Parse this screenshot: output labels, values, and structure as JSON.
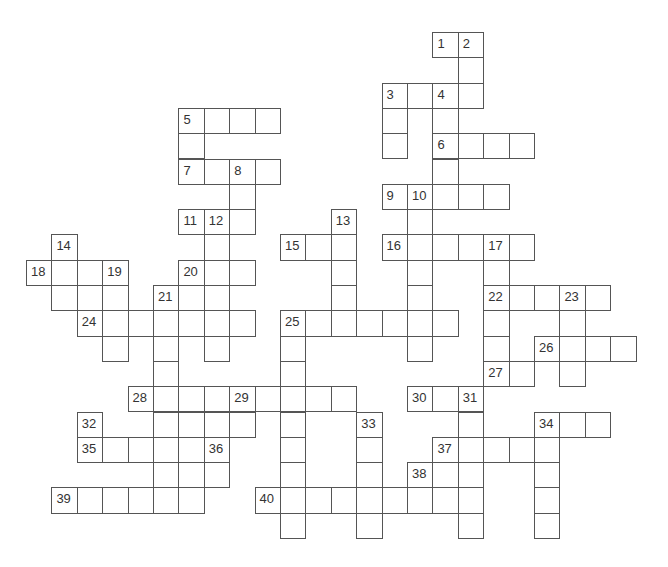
{
  "puzzle": {
    "type": "crossword",
    "grid": {
      "origin_x": 26,
      "origin_y": 32,
      "cell_w": 25.4,
      "cell_h": 25.3,
      "cols": 25,
      "rows": 20
    },
    "colors": {
      "border": "#555555",
      "cell_bg": "#ffffff",
      "number": "#333333"
    },
    "cells": [
      {
        "c": 16,
        "r": 0,
        "n": "1"
      },
      {
        "c": 17,
        "r": 0,
        "n": "2"
      },
      {
        "c": 17,
        "r": 1
      },
      {
        "c": 14,
        "r": 2,
        "n": "3"
      },
      {
        "c": 15,
        "r": 2
      },
      {
        "c": 16,
        "r": 2,
        "n": "4"
      },
      {
        "c": 17,
        "r": 2
      },
      {
        "c": 6,
        "r": 3,
        "n": "5"
      },
      {
        "c": 7,
        "r": 3
      },
      {
        "c": 8,
        "r": 3
      },
      {
        "c": 9,
        "r": 3
      },
      {
        "c": 14,
        "r": 3
      },
      {
        "c": 16,
        "r": 3
      },
      {
        "c": 6,
        "r": 4
      },
      {
        "c": 14,
        "r": 4
      },
      {
        "c": 16,
        "r": 4,
        "n": "6"
      },
      {
        "c": 17,
        "r": 4
      },
      {
        "c": 18,
        "r": 4
      },
      {
        "c": 19,
        "r": 4
      },
      {
        "c": 6,
        "r": 5,
        "n": "7"
      },
      {
        "c": 7,
        "r": 5
      },
      {
        "c": 8,
        "r": 5,
        "n": "8"
      },
      {
        "c": 9,
        "r": 5
      },
      {
        "c": 16,
        "r": 5
      },
      {
        "c": 8,
        "r": 6
      },
      {
        "c": 14,
        "r": 6,
        "n": "9"
      },
      {
        "c": 15,
        "r": 6,
        "n": "10"
      },
      {
        "c": 16,
        "r": 6
      },
      {
        "c": 17,
        "r": 6
      },
      {
        "c": 18,
        "r": 6
      },
      {
        "c": 6,
        "r": 7,
        "n": "11"
      },
      {
        "c": 7,
        "r": 7,
        "n": "12"
      },
      {
        "c": 8,
        "r": 7
      },
      {
        "c": 12,
        "r": 7,
        "n": "13"
      },
      {
        "c": 15,
        "r": 7
      },
      {
        "c": 1,
        "r": 8,
        "n": "14"
      },
      {
        "c": 7,
        "r": 8
      },
      {
        "c": 10,
        "r": 8,
        "n": "15"
      },
      {
        "c": 11,
        "r": 8
      },
      {
        "c": 12,
        "r": 8
      },
      {
        "c": 14,
        "r": 8,
        "n": "16"
      },
      {
        "c": 15,
        "r": 8
      },
      {
        "c": 16,
        "r": 8
      },
      {
        "c": 17,
        "r": 8
      },
      {
        "c": 18,
        "r": 8,
        "n": "17"
      },
      {
        "c": 19,
        "r": 8
      },
      {
        "c": 0,
        "r": 9,
        "n": "18"
      },
      {
        "c": 1,
        "r": 9
      },
      {
        "c": 2,
        "r": 9
      },
      {
        "c": 3,
        "r": 9,
        "n": "19"
      },
      {
        "c": 6,
        "r": 9,
        "n": "20"
      },
      {
        "c": 7,
        "r": 9
      },
      {
        "c": 8,
        "r": 9
      },
      {
        "c": 12,
        "r": 9
      },
      {
        "c": 15,
        "r": 9
      },
      {
        "c": 18,
        "r": 9
      },
      {
        "c": 1,
        "r": 10
      },
      {
        "c": 2,
        "r": 10
      },
      {
        "c": 3,
        "r": 10
      },
      {
        "c": 5,
        "r": 10,
        "n": "21"
      },
      {
        "c": 6,
        "r": 10
      },
      {
        "c": 7,
        "r": 10
      },
      {
        "c": 12,
        "r": 10
      },
      {
        "c": 15,
        "r": 10
      },
      {
        "c": 18,
        "r": 10,
        "n": "22"
      },
      {
        "c": 19,
        "r": 10
      },
      {
        "c": 20,
        "r": 10
      },
      {
        "c": 21,
        "r": 10,
        "n": "23"
      },
      {
        "c": 22,
        "r": 10
      },
      {
        "c": 2,
        "r": 11,
        "n": "24"
      },
      {
        "c": 3,
        "r": 11
      },
      {
        "c": 4,
        "r": 11
      },
      {
        "c": 5,
        "r": 11
      },
      {
        "c": 6,
        "r": 11
      },
      {
        "c": 7,
        "r": 11
      },
      {
        "c": 8,
        "r": 11
      },
      {
        "c": 10,
        "r": 11,
        "n": "25"
      },
      {
        "c": 11,
        "r": 11
      },
      {
        "c": 12,
        "r": 11
      },
      {
        "c": 13,
        "r": 11
      },
      {
        "c": 14,
        "r": 11
      },
      {
        "c": 15,
        "r": 11
      },
      {
        "c": 16,
        "r": 11
      },
      {
        "c": 18,
        "r": 11
      },
      {
        "c": 21,
        "r": 11
      },
      {
        "c": 3,
        "r": 12
      },
      {
        "c": 5,
        "r": 12
      },
      {
        "c": 7,
        "r": 12
      },
      {
        "c": 10,
        "r": 12
      },
      {
        "c": 15,
        "r": 12
      },
      {
        "c": 18,
        "r": 12
      },
      {
        "c": 20,
        "r": 12,
        "n": "26"
      },
      {
        "c": 21,
        "r": 12
      },
      {
        "c": 22,
        "r": 12
      },
      {
        "c": 23,
        "r": 12
      },
      {
        "c": 5,
        "r": 13
      },
      {
        "c": 10,
        "r": 13
      },
      {
        "c": 18,
        "r": 13,
        "n": "27"
      },
      {
        "c": 19,
        "r": 13
      },
      {
        "c": 21,
        "r": 13
      },
      {
        "c": 4,
        "r": 14,
        "n": "28"
      },
      {
        "c": 5,
        "r": 14
      },
      {
        "c": 6,
        "r": 14
      },
      {
        "c": 7,
        "r": 14
      },
      {
        "c": 8,
        "r": 14,
        "n": "29"
      },
      {
        "c": 9,
        "r": 14
      },
      {
        "c": 10,
        "r": 14
      },
      {
        "c": 11,
        "r": 14
      },
      {
        "c": 12,
        "r": 14
      },
      {
        "c": 15,
        "r": 14,
        "n": "30"
      },
      {
        "c": 16,
        "r": 14
      },
      {
        "c": 17,
        "r": 14,
        "n": "31"
      },
      {
        "c": 2,
        "r": 15,
        "n": "32"
      },
      {
        "c": 5,
        "r": 15
      },
      {
        "c": 6,
        "r": 15
      },
      {
        "c": 7,
        "r": 15
      },
      {
        "c": 8,
        "r": 15
      },
      {
        "c": 10,
        "r": 15
      },
      {
        "c": 13,
        "r": 15,
        "n": "33"
      },
      {
        "c": 17,
        "r": 15
      },
      {
        "c": 20,
        "r": 15,
        "n": "34"
      },
      {
        "c": 21,
        "r": 15
      },
      {
        "c": 22,
        "r": 15
      },
      {
        "c": 2,
        "r": 16,
        "n": "35"
      },
      {
        "c": 3,
        "r": 16
      },
      {
        "c": 4,
        "r": 16
      },
      {
        "c": 5,
        "r": 16
      },
      {
        "c": 6,
        "r": 16
      },
      {
        "c": 7,
        "r": 16,
        "n": "36"
      },
      {
        "c": 10,
        "r": 16
      },
      {
        "c": 13,
        "r": 16
      },
      {
        "c": 16,
        "r": 16,
        "n": "37"
      },
      {
        "c": 17,
        "r": 16
      },
      {
        "c": 18,
        "r": 16
      },
      {
        "c": 19,
        "r": 16
      },
      {
        "c": 20,
        "r": 16
      },
      {
        "c": 5,
        "r": 17
      },
      {
        "c": 6,
        "r": 17
      },
      {
        "c": 7,
        "r": 17
      },
      {
        "c": 10,
        "r": 17
      },
      {
        "c": 13,
        "r": 17
      },
      {
        "c": 15,
        "r": 17,
        "n": "38"
      },
      {
        "c": 16,
        "r": 17
      },
      {
        "c": 17,
        "r": 17
      },
      {
        "c": 20,
        "r": 17
      },
      {
        "c": 1,
        "r": 18,
        "n": "39"
      },
      {
        "c": 2,
        "r": 18
      },
      {
        "c": 3,
        "r": 18
      },
      {
        "c": 4,
        "r": 18
      },
      {
        "c": 5,
        "r": 18
      },
      {
        "c": 6,
        "r": 18
      },
      {
        "c": 9,
        "r": 18,
        "n": "40"
      },
      {
        "c": 10,
        "r": 18
      },
      {
        "c": 11,
        "r": 18
      },
      {
        "c": 12,
        "r": 18
      },
      {
        "c": 13,
        "r": 18
      },
      {
        "c": 14,
        "r": 18
      },
      {
        "c": 15,
        "r": 18
      },
      {
        "c": 16,
        "r": 18
      },
      {
        "c": 17,
        "r": 18
      },
      {
        "c": 20,
        "r": 18
      },
      {
        "c": 10,
        "r": 19
      },
      {
        "c": 13,
        "r": 19
      },
      {
        "c": 17,
        "r": 19
      },
      {
        "c": 20,
        "r": 19
      }
    ]
  }
}
